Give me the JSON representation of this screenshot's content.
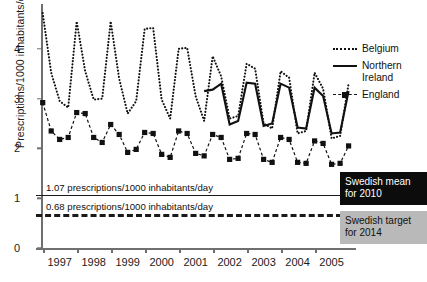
{
  "chart_data": {
    "type": "line",
    "title": "",
    "xlabel": "",
    "ylabel": "Prescriptions/1000 inhabitants/day",
    "ylim": [
      0,
      4.9
    ],
    "yticks": [
      "0",
      "1",
      "2",
      "3",
      "4"
    ],
    "xlim": [
      1996.75,
      2005.9
    ],
    "xticks": [
      "1997",
      "1998",
      "1999",
      "2000",
      "2001",
      "2002",
      "2003",
      "2004",
      "2005"
    ],
    "grid": false,
    "legend_position": "right",
    "legend": [
      {
        "name": "Belgium",
        "style": "dotted"
      },
      {
        "name": "Northern\nIreland",
        "style": "solid"
      },
      {
        "name": "England",
        "style": "dashed-square"
      }
    ],
    "series": [
      {
        "name": "Belgium",
        "style": "dotted",
        "x": [
          1996.8,
          1997.05,
          1997.3,
          1997.55,
          1997.8,
          1998.05,
          1998.3,
          1998.55,
          1998.8,
          1999.05,
          1999.3,
          1999.55,
          1999.8,
          2000.05,
          2000.3,
          2000.55,
          2000.8,
          2001.05,
          2001.3,
          2001.55,
          2001.8,
          2002.05,
          2002.3,
          2002.55,
          2002.8,
          2003.05,
          2003.3,
          2003.55,
          2003.8,
          2004.05,
          2004.3,
          2004.55,
          2004.8,
          2005.05,
          2005.3,
          2005.55,
          2005.8
        ],
        "y": [
          4.72,
          3.52,
          2.95,
          2.82,
          4.55,
          3.55,
          2.98,
          3.0,
          4.55,
          3.4,
          2.7,
          2.95,
          4.4,
          4.42,
          2.98,
          2.6,
          4.0,
          4.02,
          3.05,
          2.55,
          3.85,
          3.45,
          2.6,
          2.65,
          3.7,
          3.6,
          2.5,
          2.4,
          3.55,
          3.42,
          2.3,
          2.35,
          3.52,
          3.2,
          2.2,
          2.25,
          3.3
        ]
      },
      {
        "name": "Northern Ireland",
        "style": "solid",
        "x": [
          2001.55,
          2001.8,
          2002.05,
          2002.3,
          2002.55,
          2002.8,
          2003.05,
          2003.3,
          2003.55,
          2003.8,
          2004.05,
          2004.3,
          2004.55,
          2004.8,
          2005.05,
          2005.3,
          2005.55,
          2005.8
        ],
        "y": [
          3.15,
          3.18,
          3.3,
          2.48,
          2.55,
          3.32,
          3.3,
          2.45,
          2.5,
          3.3,
          3.22,
          2.42,
          2.4,
          3.22,
          3.05,
          2.3,
          2.32,
          3.15
        ]
      },
      {
        "name": "England",
        "style": "dashed-square",
        "x": [
          1996.8,
          1997.05,
          1997.3,
          1997.55,
          1997.8,
          1998.05,
          1998.3,
          1998.55,
          1998.8,
          1999.05,
          1999.3,
          1999.55,
          1999.8,
          2000.05,
          2000.3,
          2000.55,
          2000.8,
          2001.05,
          2001.3,
          2001.55,
          2001.8,
          2002.05,
          2002.3,
          2002.55,
          2002.8,
          2003.05,
          2003.3,
          2003.55,
          2003.8,
          2004.05,
          2004.3,
          2004.55,
          2004.8,
          2005.05,
          2005.3,
          2005.55,
          2005.8
        ],
        "y": [
          2.92,
          2.35,
          2.18,
          2.22,
          2.72,
          2.7,
          2.22,
          2.12,
          2.48,
          2.28,
          1.92,
          1.98,
          2.32,
          2.3,
          1.88,
          1.82,
          2.35,
          2.3,
          1.9,
          1.85,
          2.28,
          2.22,
          1.78,
          1.8,
          2.3,
          2.28,
          1.78,
          1.72,
          2.22,
          2.18,
          1.72,
          1.7,
          2.15,
          2.1,
          1.68,
          1.7,
          2.05
        ]
      }
    ],
    "reference_lines": [
      {
        "value": 1.07,
        "style": "solid",
        "label": "1.07 prescriptions/1000 inhabitants/day",
        "callout": "Swedish mean\nfor 2010",
        "callout_bg": "#0c0c0c",
        "callout_fg": "#ffffff"
      },
      {
        "value": 0.68,
        "style": "dashed",
        "label": "0.68 prescriptions/1000 inhabitants/day",
        "callout": "Swedish target\nfor 2014",
        "callout_bg": "#b9b9b9",
        "callout_fg": "#111111"
      }
    ],
    "colors": {
      "ink": "#111111",
      "axis": "#6f6f6f",
      "callout_dark": "#0c0c0c",
      "callout_grey": "#b9b9b9"
    }
  }
}
